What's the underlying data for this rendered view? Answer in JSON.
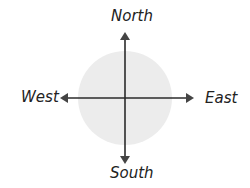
{
  "diagram": {
    "labels": {
      "north": "North",
      "south": "South",
      "east": "East",
      "west": "West"
    },
    "colors": {
      "circle": "#ececec",
      "arrow": "#2b2b2b",
      "text": "#222222"
    }
  }
}
